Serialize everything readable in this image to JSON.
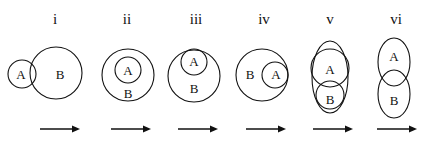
{
  "figure": {
    "type": "diagram",
    "subtype": "venn-euler-sequence",
    "width": 430,
    "height": 146,
    "background_color": "#ffffff",
    "stroke_color": "#111111",
    "text_color": "#111111"
  },
  "panels": [
    {
      "numeral": "i",
      "numeral_x": 55,
      "numeral_y": 24,
      "relation": "partial-overlap",
      "shapes": [
        {
          "kind": "circle",
          "name": "set-a",
          "cx": 22,
          "cy": 74,
          "r": 14
        },
        {
          "kind": "circle",
          "name": "set-b",
          "cx": 56,
          "cy": 73,
          "r": 26
        }
      ],
      "labels": [
        {
          "text": "A",
          "x": 21,
          "y": 74
        },
        {
          "text": "B",
          "x": 60,
          "y": 74
        }
      ],
      "arrow": {
        "x1": 40,
        "x2": 80,
        "y": 129
      }
    },
    {
      "numeral": "ii",
      "numeral_x": 127,
      "numeral_y": 24,
      "relation": "a-strictly-inside-b",
      "shapes": [
        {
          "kind": "circle",
          "name": "set-b",
          "cx": 128,
          "cy": 75,
          "r": 26
        },
        {
          "kind": "circle",
          "name": "set-a",
          "cx": 128,
          "cy": 70,
          "r": 13
        }
      ],
      "labels": [
        {
          "text": "A",
          "x": 128,
          "y": 70
        },
        {
          "text": "B",
          "x": 128,
          "y": 93
        }
      ],
      "arrow": {
        "x1": 111,
        "x2": 151,
        "y": 129
      }
    },
    {
      "numeral": "iii",
      "numeral_x": 196,
      "numeral_y": 24,
      "relation": "a-internally-tangent-top-of-b",
      "shapes": [
        {
          "kind": "circle",
          "name": "set-b",
          "cx": 194,
          "cy": 76,
          "r": 26
        },
        {
          "kind": "circle",
          "name": "set-a",
          "cx": 194,
          "cy": 62,
          "r": 13
        }
      ],
      "labels": [
        {
          "text": "A",
          "x": 194,
          "y": 61
        },
        {
          "text": "B",
          "x": 194,
          "y": 88
        }
      ],
      "arrow": {
        "x1": 178,
        "x2": 218,
        "y": 129
      }
    },
    {
      "numeral": "iv",
      "numeral_x": 264,
      "numeral_y": 24,
      "relation": "a-internally-tangent-right-of-b",
      "shapes": [
        {
          "kind": "circle",
          "name": "set-b",
          "cx": 262,
          "cy": 75,
          "r": 26
        },
        {
          "kind": "circle",
          "name": "set-a",
          "cx": 275,
          "cy": 75,
          "r": 13
        }
      ],
      "labels": [
        {
          "text": "B",
          "x": 250,
          "y": 74
        },
        {
          "text": "A",
          "x": 276,
          "y": 74
        }
      ],
      "arrow": {
        "x1": 246,
        "x2": 286,
        "y": 129
      }
    },
    {
      "numeral": "v",
      "numeral_x": 330,
      "numeral_y": 24,
      "relation": "a-and-b-inside-tall-ellipse-a-crossing",
      "shapes": [
        {
          "kind": "ellipse",
          "name": "outer-boundary",
          "cx": 330,
          "cy": 77,
          "rx": 18,
          "ry": 36
        },
        {
          "kind": "circle",
          "name": "set-a",
          "cx": 330,
          "cy": 68,
          "r": 19
        },
        {
          "kind": "circle",
          "name": "set-b",
          "cx": 330,
          "cy": 95,
          "r": 14
        }
      ],
      "labels": [
        {
          "text": "A",
          "x": 330,
          "y": 69
        },
        {
          "text": "B",
          "x": 330,
          "y": 99
        }
      ],
      "arrow": {
        "x1": 313,
        "x2": 353,
        "y": 129
      }
    },
    {
      "numeral": "vi",
      "numeral_x": 396,
      "numeral_y": 24,
      "relation": "two-vertical-ellipses-small-lens-overlap",
      "shapes": [
        {
          "kind": "ellipse",
          "name": "set-a",
          "cx": 394,
          "cy": 62,
          "rx": 16,
          "ry": 24
        },
        {
          "kind": "ellipse",
          "name": "set-b",
          "cx": 394,
          "cy": 94,
          "rx": 16,
          "ry": 24
        }
      ],
      "labels": [
        {
          "text": "A",
          "x": 394,
          "y": 56
        },
        {
          "text": "B",
          "x": 394,
          "y": 100
        }
      ],
      "arrow": {
        "x1": 377,
        "x2": 417,
        "y": 129
      }
    }
  ]
}
